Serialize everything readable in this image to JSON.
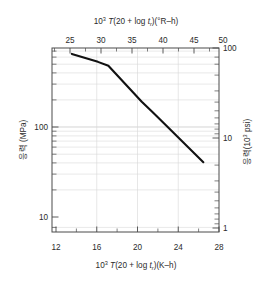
{
  "chart_data": {
    "type": "line",
    "title": "",
    "top_axis": {
      "label_prefix": "10",
      "label_exp": "3",
      "label_mid_italic": "T",
      "label_body": "(20 + log ",
      "label_t": "t",
      "label_t_sub": "r",
      "label_tail": ")(°R–h)",
      "label_full": "10³ T(20 + log tᵣ)(°R–h)",
      "ticks": [
        25,
        30,
        35,
        40,
        45,
        50
      ],
      "min": 21.6,
      "max": 50.4
    },
    "bottom_axis": {
      "label_prefix": "10",
      "label_exp": "3",
      "label_mid_italic": "T",
      "label_body": "(20 + log ",
      "label_t": "t",
      "label_t_sub": "r",
      "label_tail": ")(K–h)",
      "label_full": "10³ T(20 + log tᵣ)(K–h)",
      "ticks": [
        12,
        16,
        20,
        24,
        28
      ],
      "min": 12,
      "max": 28
    },
    "left_axis": {
      "label": "응력 (MPa)",
      "ticks": [
        10,
        100
      ],
      "tick_labels": [
        "10",
        "100"
      ],
      "min": 7.0,
      "max": 270.0,
      "scale": "log",
      "units": "MPa"
    },
    "right_axis": {
      "label_prefix": "응력(10",
      "label_exp": "3",
      "label_tail": " psi)",
      "label_full": "응력(10³ psi)",
      "ticks": [
        1,
        10,
        100
      ],
      "tick_labels": [
        "1",
        "10",
        "100"
      ],
      "min": 1.0,
      "max": 100.0,
      "scale": "log",
      "units": "10³ psi"
    },
    "grid": true,
    "legend": "none",
    "series": [
      {
        "name": "stress-rupture",
        "x": [
          13.9,
          16.4,
          17.4,
          20.6,
          21.6,
          22.6,
          26.5
        ],
        "y": [
          240,
          205,
          190,
          93,
          76,
          62,
          28
        ],
        "xlabel": "10³ T(20 + log tᵣ)(K–h)",
        "ylabel": "응력 (MPa)"
      }
    ]
  },
  "colors": {
    "curve": "#111111",
    "frame": "#4a4a4a",
    "grid": "#d9d9d9",
    "background": "#ffffff",
    "text": "#2b2b2b"
  }
}
